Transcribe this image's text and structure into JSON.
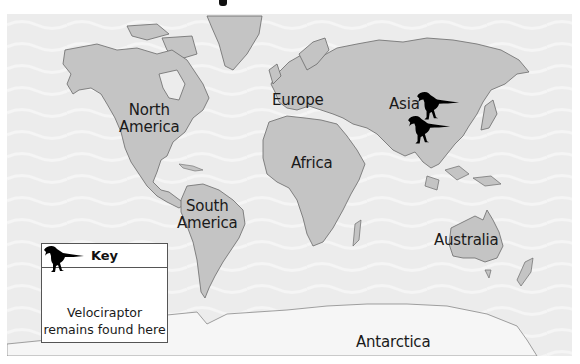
{
  "map": {
    "title_partial_glyph": "?",
    "ocean_color": "#ececec",
    "land_color": "#c4c4c4",
    "antarctica_color": "#f6f6f6",
    "outline_color": "#6a6a6a",
    "marker_color": "#000000"
  },
  "labels": {
    "north_america": [
      "North",
      "America"
    ],
    "south_america": [
      "South",
      "America"
    ],
    "europe": "Europe",
    "africa": "Africa",
    "asia": "Asia",
    "australia": "Australia",
    "antarctica": "Antarctica"
  },
  "markers": [
    {
      "name": "velociraptor-marker-asia-north",
      "region": "Asia"
    },
    {
      "name": "velociraptor-marker-asia-south",
      "region": "Asia"
    }
  ],
  "key": {
    "title": "Key",
    "icon": "velociraptor-icon",
    "line1": "Velociraptor",
    "line2": "remains found here"
  }
}
